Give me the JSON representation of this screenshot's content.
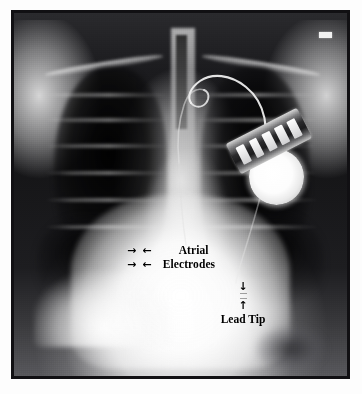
{
  "figure": {
    "kind": "chest-radiograph",
    "view": "posteroanterior chest X-ray"
  },
  "annotations": {
    "atrial": {
      "label": "Atrial",
      "arrow_right": "→",
      "arrow_left": "←"
    },
    "electrodes": {
      "label": "Electrodes",
      "arrow_right": "→",
      "arrow_left": "←"
    },
    "lead_tip": {
      "label": "Lead Tip",
      "arrow_down": "↓",
      "arrow_up": "↑"
    }
  },
  "hardware": {
    "generator_name": "pacemaker-generator-can",
    "header_name": "pacemaker-connector-header",
    "lead_name": "pacing-lead-wire",
    "marker_name": "radiographic-side-marker"
  },
  "colors": {
    "frame_border": "#111013",
    "page_background": "#fdfdfd",
    "film_dark": "#141416",
    "film_bright": "#ffffff",
    "annotation_text": "#000000"
  }
}
